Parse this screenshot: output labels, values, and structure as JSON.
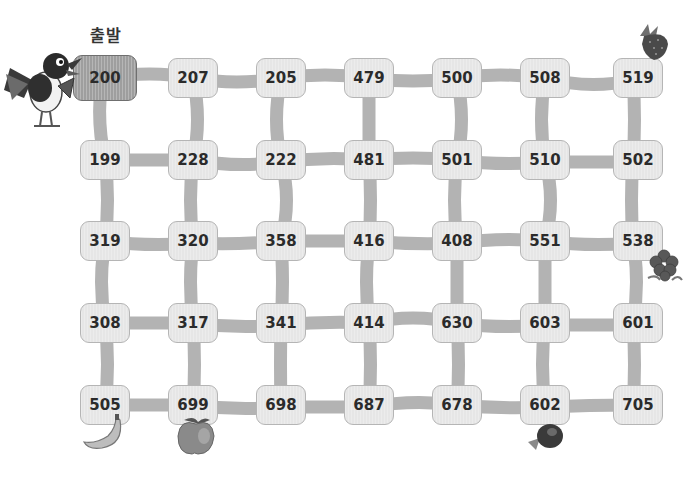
{
  "start_label": "출발",
  "grid": {
    "rows": [
      [
        "200",
        "207",
        "205",
        "479",
        "500",
        "508",
        "519"
      ],
      [
        "199",
        "228",
        "222",
        "481",
        "501",
        "510",
        "502"
      ],
      [
        "319",
        "320",
        "358",
        "416",
        "408",
        "551",
        "538"
      ],
      [
        "308",
        "317",
        "341",
        "414",
        "630",
        "603",
        "601"
      ],
      [
        "505",
        "699",
        "698",
        "687",
        "678",
        "602",
        "705"
      ]
    ],
    "start_cell": "200"
  },
  "decorations": {
    "character": "magpie-bird",
    "fruits": [
      {
        "name": "strawberry",
        "near": "519"
      },
      {
        "name": "grapes",
        "near": "538"
      },
      {
        "name": "banana",
        "near": "505"
      },
      {
        "name": "apple",
        "near": "699"
      },
      {
        "name": "plum",
        "near": "602"
      }
    ]
  },
  "colors": {
    "cell_bg": "#e6e6e6",
    "start_cell_bg": "#9e9e9e",
    "path": "#b3b3b3",
    "text": "#2b2b2b"
  }
}
